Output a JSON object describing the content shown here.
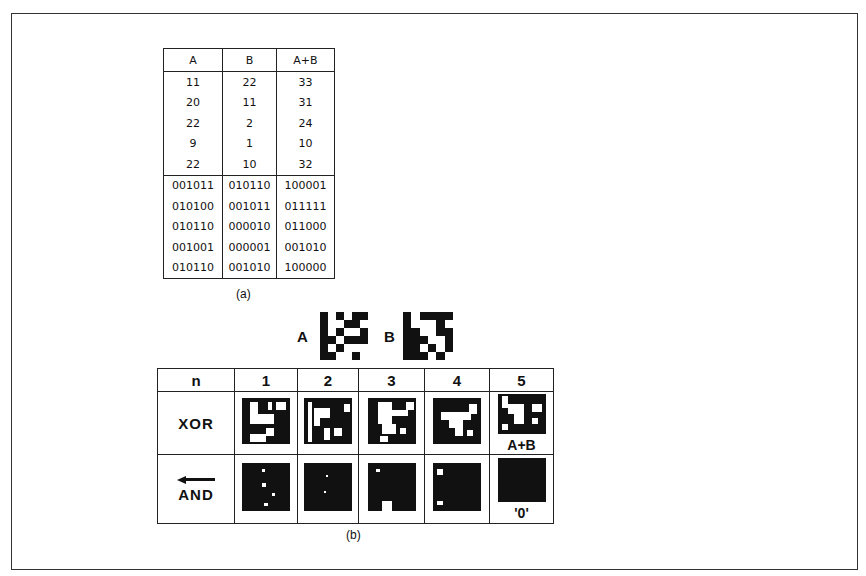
{
  "figure": {
    "table_a": {
      "headers": [
        "A",
        "B",
        "A+B"
      ],
      "decimal_rows": [
        [
          "11",
          "22",
          "33"
        ],
        [
          "20",
          "11",
          "31"
        ],
        [
          "22",
          "2",
          "24"
        ],
        [
          "9",
          "1",
          "10"
        ],
        [
          "22",
          "10",
          "32"
        ]
      ],
      "binary_rows": [
        [
          "001011",
          "010110",
          "100001"
        ],
        [
          "010100",
          "001011",
          "011111"
        ],
        [
          "010110",
          "000010",
          "011000"
        ],
        [
          "001001",
          "000001",
          "001010"
        ],
        [
          "010110",
          "001010",
          "100000"
        ]
      ],
      "caption": "(a)"
    },
    "inputs": {
      "a_label": "A",
      "b_label": "B",
      "a_pattern": [
        "101011",
        "100110",
        "101001",
        "110111",
        "101000",
        "110010"
      ],
      "b_pattern": [
        "101111",
        "100010",
        "110011",
        "111001",
        "110101",
        "111010"
      ]
    },
    "table_b": {
      "header_label": "n",
      "columns": [
        "1",
        "2",
        "3",
        "4",
        "5"
      ],
      "xor_label": "XOR",
      "and_label": "AND",
      "xor_note_col5": "A+B",
      "and_note_col5": "'0'",
      "caption": "(b)"
    }
  }
}
